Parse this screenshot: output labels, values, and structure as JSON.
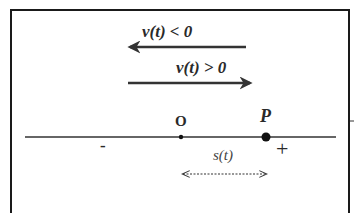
{
  "diagram": {
    "arrows": {
      "negative_velocity": {
        "label": "v(t) < 0",
        "direction": "left"
      },
      "positive_velocity": {
        "label": "v(t) > 0",
        "direction": "right"
      }
    },
    "number_line": {
      "origin_label": "O",
      "point_label": "P",
      "negative_sign": "-",
      "positive_sign": "+",
      "displacement_label": "s(t)"
    },
    "colors": {
      "stroke": "#333333",
      "frame": "#1a1a1a",
      "background": "#ffffff"
    }
  }
}
